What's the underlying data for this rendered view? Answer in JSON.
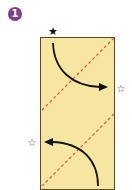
{
  "step": {
    "number": "1",
    "badge_color": "#7b3f8f"
  },
  "paper": {
    "fill": "#f7e6a0",
    "border": "#5a4a2a",
    "x": 40,
    "y": 37,
    "width": 75,
    "height": 153
  },
  "fold_lines": {
    "color": "#e0524a",
    "style": "dashed",
    "lines": [
      {
        "x1": 115,
        "y1": 37,
        "x2": 40,
        "y2": 112
      },
      {
        "x1": 115,
        "y1": 113,
        "x2": 40,
        "y2": 188
      }
    ]
  },
  "arrows": [
    {
      "name": "top-arrow",
      "from": "filled-star",
      "to": "outline-star-right",
      "color": "#111111"
    },
    {
      "name": "bottom-arrow",
      "from": "bottom-center",
      "to": "outline-star-left",
      "color": "#111111"
    }
  ],
  "markers": {
    "filled_star": {
      "glyph": "★",
      "x": 53,
      "y": 31
    },
    "outline_star_right": {
      "glyph": "☆",
      "x": 121,
      "y": 88
    },
    "outline_star_left": {
      "glyph": "☆",
      "x": 32,
      "y": 142
    }
  }
}
